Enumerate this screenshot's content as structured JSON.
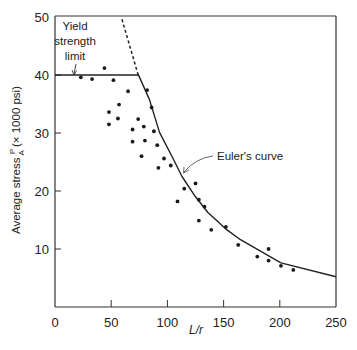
{
  "chart_data": {
    "type": "scatter",
    "title": "",
    "xlabel": "L/r",
    "ylabel": "Average stress P/A (× 1000 psi)",
    "ylabel_parts": {
      "pre": "Average stress ",
      "num": "P",
      "den": "A",
      "post": " (× 1000 psi)"
    },
    "xlim": [
      0,
      250
    ],
    "ylim": [
      0,
      50
    ],
    "xticks": [
      0,
      50,
      100,
      150,
      200,
      250
    ],
    "yticks": [
      10,
      20,
      30,
      40,
      50
    ],
    "grid": false,
    "legend": null,
    "series": [
      {
        "name": "Test data",
        "kind": "points",
        "points": [
          [
            23,
            39.6
          ],
          [
            33,
            39.3
          ],
          [
            44,
            41.2
          ],
          [
            52,
            39.1
          ],
          [
            65,
            37.2
          ],
          [
            82,
            37.4
          ],
          [
            57,
            34.9
          ],
          [
            86,
            34.4
          ],
          [
            48,
            33.6
          ],
          [
            56,
            32.5
          ],
          [
            74,
            32.4
          ],
          [
            48,
            31.5
          ],
          [
            69,
            30.6
          ],
          [
            79,
            31.1
          ],
          [
            88,
            30.3
          ],
          [
            69,
            28.5
          ],
          [
            80,
            28.7
          ],
          [
            91,
            27.9
          ],
          [
            77,
            26.0
          ],
          [
            97,
            25.6
          ],
          [
            92,
            24.0
          ],
          [
            103,
            24.4
          ],
          [
            115,
            20.4
          ],
          [
            125,
            21.3
          ],
          [
            109,
            18.2
          ],
          [
            128,
            18.5
          ],
          [
            133,
            17.3
          ],
          [
            128,
            14.9
          ],
          [
            139,
            13.3
          ],
          [
            152,
            13.8
          ],
          [
            163,
            10.7
          ],
          [
            180,
            8.7
          ],
          [
            190,
            10.0
          ],
          [
            190,
            8.0
          ],
          [
            201,
            7.1
          ],
          [
            212,
            6.4
          ]
        ]
      },
      {
        "name": "Yield strength limit",
        "kind": "line",
        "points": [
          [
            0,
            40
          ],
          [
            74,
            40
          ]
        ]
      },
      {
        "name": "Euler's curve",
        "kind": "line",
        "points": [
          [
            74,
            40.1
          ],
          [
            84,
            35.8
          ],
          [
            93,
            30.1
          ],
          [
            104,
            26.0
          ],
          [
            113,
            22.5
          ],
          [
            125,
            19.0
          ],
          [
            136,
            16.3
          ],
          [
            153,
            13.3
          ],
          [
            165,
            11.6
          ],
          [
            201,
            7.6
          ],
          [
            250,
            5.2
          ]
        ]
      },
      {
        "name": "Euler's curve (extension)",
        "kind": "dashed-line",
        "points": [
          [
            74,
            40
          ],
          [
            59,
            50
          ]
        ]
      }
    ],
    "annotations": [
      {
        "id": "yield",
        "lines": [
          "Yield",
          "strength",
          "limit"
        ],
        "target": [
          17,
          40
        ]
      },
      {
        "id": "euler",
        "text": "Euler's curve",
        "target": [
          114,
          22.6
        ]
      }
    ]
  }
}
